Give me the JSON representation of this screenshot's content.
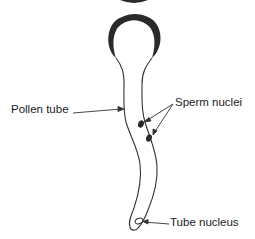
{
  "diagram": {
    "type": "labeled biological diagram",
    "colors": {
      "stroke": "#333333",
      "fill_dark": "#2a2a2a",
      "background": "#ffffff"
    },
    "labels": [
      {
        "id": "pollen-tube",
        "text": "Pollen tube"
      },
      {
        "id": "sperm-nuclei",
        "text": "Sperm nuclei"
      },
      {
        "id": "tube-nucleus",
        "text": "Tube nucleus"
      }
    ]
  }
}
